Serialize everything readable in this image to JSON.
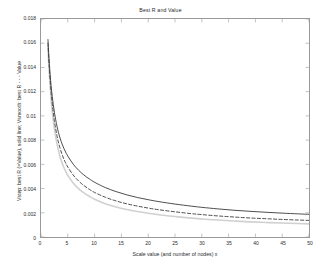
{
  "chart_data": {
    "type": "line",
    "title": "Best R and Value",
    "xlabel": "Scale value (and number of nodes) x",
    "ylabel": "Vstep: best R (=Value), solid line; Vsmooth: best R - - - Value",
    "xlim": [
      0,
      50
    ],
    "ylim": [
      0,
      0.018
    ],
    "xticks": [
      0,
      5,
      10,
      15,
      20,
      25,
      30,
      35,
      40,
      45,
      50
    ],
    "yticks": [
      0,
      0.002,
      0.004,
      0.006,
      0.008,
      0.01,
      0.012,
      0.014,
      0.016,
      0.018
    ],
    "grid": false,
    "legend": "none",
    "series": [
      {
        "name": "Vstep: best R (=Value)",
        "style": "solid",
        "color": "#3a3a3a",
        "width": 0.9,
        "x": [
          1.3,
          1.5,
          1.8,
          2.1,
          2.5,
          3,
          3.5,
          4,
          4.5,
          5,
          6,
          7,
          8,
          9,
          10,
          12,
          14,
          16,
          18,
          20,
          22,
          25,
          28,
          30,
          33,
          36,
          39,
          42,
          45,
          48,
          50
        ],
        "y": [
          0.0163,
          0.0147,
          0.0129,
          0.0116,
          0.0103,
          0.0091,
          0.00825,
          0.0076,
          0.0071,
          0.00668,
          0.00602,
          0.00552,
          0.00512,
          0.0048,
          0.00452,
          0.00408,
          0.00375,
          0.00348,
          0.00326,
          0.00308,
          0.00292,
          0.00272,
          0.00255,
          0.00245,
          0.00232,
          0.00221,
          0.00212,
          0.00204,
          0.00197,
          0.00191,
          0.00187
        ]
      },
      {
        "name": "Vsmooth: best R",
        "style": "dashed",
        "color": "#3a3a3a",
        "width": 0.9,
        "x": [
          1.3,
          1.5,
          1.8,
          2.1,
          2.5,
          3,
          3.5,
          4,
          4.5,
          5,
          6,
          7,
          8,
          9,
          10,
          12,
          14,
          16,
          18,
          20,
          22,
          25,
          28,
          30,
          33,
          36,
          39,
          42,
          45,
          48,
          50
        ],
        "y": [
          0.016,
          0.0143,
          0.0124,
          0.011,
          0.0096,
          0.00832,
          0.00742,
          0.00674,
          0.0062,
          0.00578,
          0.00512,
          0.00463,
          0.00425,
          0.00394,
          0.00368,
          0.00328,
          0.00298,
          0.00274,
          0.00255,
          0.00239,
          0.00225,
          0.00208,
          0.00193,
          0.00185,
          0.00174,
          0.00165,
          0.00157,
          0.00151,
          0.00145,
          0.0014,
          0.00137
        ]
      },
      {
        "name": "Vsmooth: Value",
        "style": "solid",
        "color": "#d0d0d0",
        "width": 1.6,
        "x": [
          1.3,
          1.5,
          1.8,
          2.1,
          2.5,
          3,
          3.5,
          4,
          4.5,
          5,
          6,
          7,
          8,
          9,
          10,
          12,
          14,
          16,
          18,
          20,
          22,
          25,
          28,
          30,
          33,
          36,
          39,
          42,
          45,
          48,
          50
        ],
        "y": [
          0.0157,
          0.0139,
          0.0119,
          0.0104,
          0.00895,
          0.00764,
          0.00672,
          0.00604,
          0.00551,
          0.00509,
          0.00446,
          0.004,
          0.00364,
          0.00336,
          0.00312,
          0.00275,
          0.00248,
          0.00227,
          0.0021,
          0.00196,
          0.00184,
          0.00169,
          0.00156,
          0.00149,
          0.0014,
          0.00132,
          0.00125,
          0.0012,
          0.00115,
          0.00111,
          0.00108
        ]
      }
    ]
  },
  "ticks": {
    "y": [
      "0",
      "0.002",
      "0.004",
      "0.006",
      "0.008",
      "0.01",
      "0.012",
      "0.014",
      "0.016",
      "0.018"
    ],
    "x": [
      "0",
      "5",
      "10",
      "15",
      "20",
      "25",
      "30",
      "35",
      "40",
      "45",
      "50"
    ]
  }
}
